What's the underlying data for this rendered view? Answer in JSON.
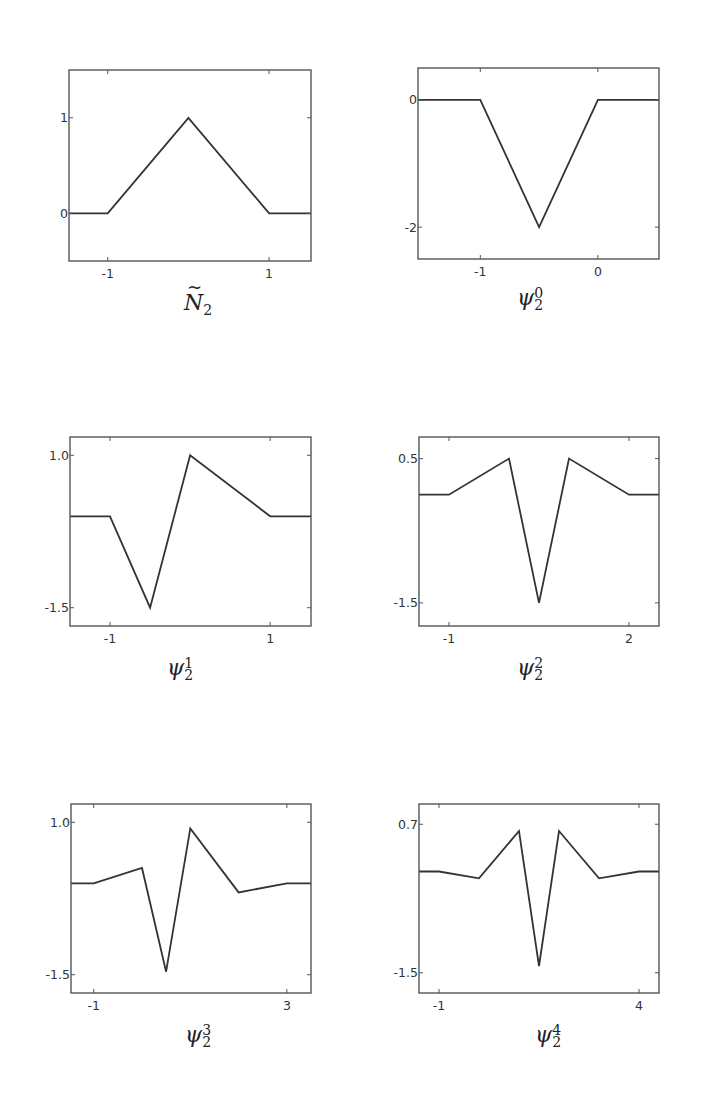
{
  "figure": {
    "background": "#ffffff",
    "line_color": "#333333",
    "frame_color": "#555555"
  },
  "chart_data": [
    {
      "type": "line",
      "id": "N2tilde",
      "title": "",
      "caption_base": "N",
      "caption_sub": "2",
      "caption_sup": "",
      "caption_tilde": true,
      "xlim": [
        -1.48,
        1.52
      ],
      "ylim": [
        -0.5,
        1.5
      ],
      "xticks": [
        -1,
        1
      ],
      "xtick_labels": [
        "-1",
        "1"
      ],
      "yticks": [
        0,
        1
      ],
      "ytick_labels": [
        "0",
        "1"
      ],
      "grid": false,
      "x": [
        -1.48,
        -1,
        0,
        1,
        1.52
      ],
      "y": [
        0,
        0,
        1,
        0,
        0
      ],
      "frame_px": {
        "left": 69,
        "top": 70,
        "right": 311,
        "bottom": 261
      }
    },
    {
      "type": "line",
      "id": "psi2_0",
      "title": "",
      "caption_base": "ψ",
      "caption_sub": "2",
      "caption_sup": "0",
      "caption_tilde": false,
      "xlim": [
        -1.53,
        0.52
      ],
      "ylim": [
        -2.5,
        0.5
      ],
      "xticks": [
        -1,
        0
      ],
      "xtick_labels": [
        "-1",
        "0"
      ],
      "yticks": [
        0,
        -2
      ],
      "ytick_labels": [
        "0",
        "-2"
      ],
      "grid": false,
      "x": [
        -1.53,
        -1,
        -0.5,
        0,
        0.52
      ],
      "y": [
        0,
        0,
        -2,
        0,
        0
      ],
      "frame_px": {
        "left": 418,
        "top": 68,
        "right": 659,
        "bottom": 259
      }
    },
    {
      "type": "line",
      "id": "psi2_1",
      "title": "",
      "caption_base": "ψ",
      "caption_sub": "2",
      "caption_sup": "1",
      "caption_tilde": false,
      "xlim": [
        -1.5,
        1.51
      ],
      "ylim": [
        -1.8,
        1.3
      ],
      "xticks": [
        -1,
        1
      ],
      "xtick_labels": [
        "-1",
        "1"
      ],
      "yticks": [
        1.0,
        -1.5
      ],
      "ytick_labels": [
        "1.0",
        "-1.5"
      ],
      "grid": false,
      "x": [
        -1.5,
        -1,
        -0.5,
        0,
        1,
        1.51
      ],
      "y": [
        0,
        0,
        -1.5,
        1,
        0,
        0
      ],
      "frame_px": {
        "left": 70,
        "top": 437,
        "right": 311,
        "bottom": 626
      }
    },
    {
      "type": "line",
      "id": "psi2_2",
      "title": "",
      "caption_base": "ψ",
      "caption_sub": "2",
      "caption_sup": "2",
      "caption_tilde": false,
      "xlim": [
        -1.5,
        2.5
      ],
      "ylim": [
        -1.82,
        0.8
      ],
      "xticks": [
        -1,
        2
      ],
      "xtick_labels": [
        "-1",
        "2"
      ],
      "yticks": [
        0.5,
        -1.5
      ],
      "ytick_labels": [
        "0.5",
        "-1.5"
      ],
      "grid": false,
      "x": [
        -1.5,
        -1,
        0,
        0.5,
        1,
        2,
        2.5
      ],
      "y": [
        0,
        0,
        0.5,
        -1.5,
        0.5,
        0,
        0
      ],
      "frame_px": {
        "left": 419,
        "top": 437,
        "right": 659,
        "bottom": 626
      }
    },
    {
      "type": "line",
      "id": "psi2_3",
      "title": "",
      "caption_base": "ψ",
      "caption_sub": "2",
      "caption_sup": "3",
      "caption_tilde": false,
      "xlim": [
        -1.47,
        3.5
      ],
      "ylim": [
        -1.8,
        1.3
      ],
      "xticks": [
        -1,
        3
      ],
      "xtick_labels": [
        "-1",
        "3"
      ],
      "yticks": [
        1.0,
        -1.5
      ],
      "ytick_labels": [
        "1.0",
        "-1.5"
      ],
      "grid": false,
      "x": [
        -1.47,
        -1,
        0,
        0.5,
        1,
        2,
        3,
        3.5
      ],
      "y": [
        0,
        0,
        0.25,
        -1.45,
        0.9,
        -0.15,
        0,
        0
      ],
      "frame_px": {
        "left": 71,
        "top": 804,
        "right": 311,
        "bottom": 993
      }
    },
    {
      "type": "line",
      "id": "psi2_4",
      "title": "",
      "caption_base": "ψ",
      "caption_sub": "2",
      "caption_sup": "4",
      "caption_tilde": false,
      "xlim": [
        -1.5,
        4.5
      ],
      "ylim": [
        -1.8,
        1.0
      ],
      "xticks": [
        -1,
        4
      ],
      "xtick_labels": [
        "-1",
        "4"
      ],
      "yticks": [
        0.7,
        -1.5
      ],
      "ytick_labels": [
        "0.7",
        "-1.5"
      ],
      "grid": false,
      "x": [
        -1.5,
        -1,
        0,
        1,
        1.5,
        2,
        3,
        4,
        4.5
      ],
      "y": [
        0,
        0,
        -0.1,
        0.6,
        -1.4,
        0.6,
        -0.1,
        0,
        0
      ],
      "frame_px": {
        "left": 419,
        "top": 804,
        "right": 659,
        "bottom": 993
      }
    }
  ]
}
